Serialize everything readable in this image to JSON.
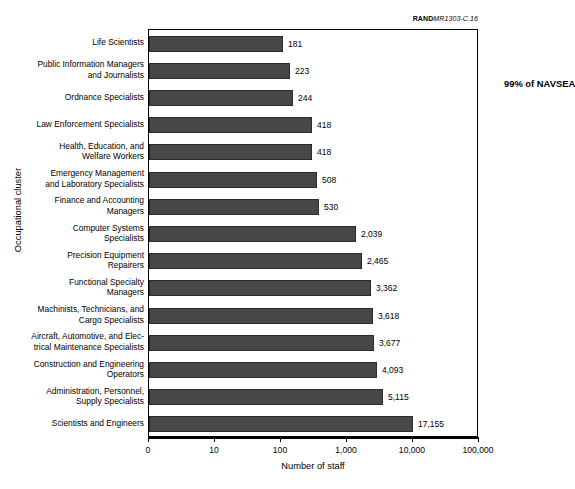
{
  "credit": {
    "brand": "RAND",
    "document": "MR1303-C.16"
  },
  "chart_data": {
    "type": "bar",
    "orientation": "horizontal",
    "title": "",
    "xlabel": "Number of staff",
    "ylabel": "Occupational cluster",
    "xscale": "log",
    "xticks": [
      0,
      10,
      100,
      1000,
      10000,
      100000
    ],
    "xtick_labels": [
      "0",
      "10",
      "100",
      "1,000",
      "10,000",
      "100,000"
    ],
    "grid": false,
    "legend": null,
    "bar_color": "#474747",
    "annotations": [
      {
        "text": "99% of NAVSEA",
        "bold": true
      }
    ],
    "categories": [
      "Life Scientists",
      "Public Information Managers and Journalists",
      "Ordnance Specialists",
      "Law Enforcement Specialists",
      "Health, Education, and Welfare Workers",
      "Emergency Management and Laboratory Specialists",
      "Finance and Accounting Managers",
      "Computer Systems Specialists",
      "Precision Equipment Repairers",
      "Functional Specialty Managers",
      "Machinists, Technicians, and Cargo Specialists",
      "Aircraft, Automotive, and Electrical Maintenance Specialists",
      "Construction and Engineering Operators",
      "Administration, Personnel, Supply Specialists",
      "Scientists and Engineers"
    ],
    "category_lines": [
      [
        "Life Scientists"
      ],
      [
        "Public Information Managers",
        "and Journalists"
      ],
      [
        "Ordnance Specialists"
      ],
      [
        "Law Enforcement Specialists"
      ],
      [
        "Health, Education, and",
        "Welfare Workers"
      ],
      [
        "Emergency Management",
        "and Laboratory Specialists"
      ],
      [
        "Finance and Accounting",
        "Managers"
      ],
      [
        "Computer Systems",
        "Specialists"
      ],
      [
        "Precision Equipment",
        "Repairers"
      ],
      [
        "Functional Specialty",
        "Managers"
      ],
      [
        "Machinists, Technicians, and",
        "Cargo Specialists"
      ],
      [
        "Aircraft, Automotive, and Elec-",
        "trical Maintenance Specialists"
      ],
      [
        "Construction and Engineering",
        "Operators"
      ],
      [
        "Administration, Personnel,",
        "Supply Specialists"
      ],
      [
        "Scientists and Engineers"
      ]
    ],
    "values": [
      181,
      223,
      244,
      418,
      418,
      508,
      530,
      2039,
      2465,
      3362,
      3618,
      3677,
      4093,
      5115,
      17155
    ],
    "value_labels": [
      "181",
      "223",
      "244",
      "418",
      "418",
      "508",
      "530",
      "2,039",
      "2,465",
      "3,362",
      "3,618",
      "3,677",
      "4,093",
      "5,115",
      "17,155"
    ],
    "bar_pixel_widths": [
      134,
      141,
      144,
      163,
      163,
      168,
      170,
      207,
      213,
      222,
      224,
      225,
      228,
      234,
      264
    ]
  }
}
